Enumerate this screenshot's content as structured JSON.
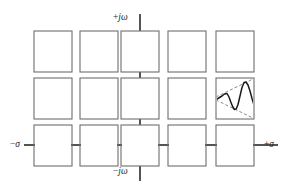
{
  "figure": {
    "type": "s-plane-pole-grid-diagram",
    "background": "#ffffff",
    "width": 292,
    "height": 193,
    "box_stroke": "#6e6e6e",
    "axis_stroke": "#2a2a2a",
    "signal_stroke": "#1a1a1a",
    "envelope_stroke": "#7a7a7a"
  },
  "axes": {
    "vertical": {
      "name": "imaginary-axis",
      "top_label": "+jω",
      "top_sign": "+",
      "top_symbol": "jω",
      "bottom_label": "−jω",
      "bottom_sign": "−",
      "bottom_symbol": "jω",
      "x": 140,
      "y_top": 14,
      "y_bottom": 181
    },
    "horizontal": {
      "name": "real-axis",
      "left_label": "−σ",
      "left_sign": "−",
      "left_symbol": "σ",
      "right_label": "+σ",
      "right_sign": "+",
      "right_symbol": "σ",
      "y": 145,
      "x_left": 24,
      "x_right": 278
    }
  },
  "grid": {
    "rows": 3,
    "cols": 5,
    "cell_w": 38,
    "cell_h": 41,
    "col_x": [
      34,
      90,
      121,
      177,
      219
    ],
    "row_y": [
      31,
      78,
      125
    ],
    "cells": [
      {
        "row": 0,
        "col": 0,
        "x": 34,
        "y": 31,
        "w": 38,
        "h": 41,
        "content": "empty"
      },
      {
        "row": 0,
        "col": 1,
        "x": 80,
        "y": 31,
        "w": 38,
        "h": 41,
        "content": "empty"
      },
      {
        "row": 0,
        "col": 2,
        "x": 121,
        "y": 31,
        "w": 38,
        "h": 41,
        "content": "empty"
      },
      {
        "row": 0,
        "col": 3,
        "x": 168,
        "y": 31,
        "w": 38,
        "h": 41,
        "content": "empty"
      },
      {
        "row": 0,
        "col": 4,
        "x": 216,
        "y": 31,
        "w": 38,
        "h": 41,
        "content": "empty"
      },
      {
        "row": 1,
        "col": 0,
        "x": 34,
        "y": 78,
        "w": 38,
        "h": 41,
        "content": "empty"
      },
      {
        "row": 1,
        "col": 1,
        "x": 80,
        "y": 78,
        "w": 38,
        "h": 41,
        "content": "empty"
      },
      {
        "row": 1,
        "col": 2,
        "x": 121,
        "y": 78,
        "w": 38,
        "h": 41,
        "content": "empty"
      },
      {
        "row": 1,
        "col": 3,
        "x": 168,
        "y": 78,
        "w": 38,
        "h": 41,
        "content": "empty"
      },
      {
        "row": 1,
        "col": 4,
        "x": 216,
        "y": 78,
        "w": 38,
        "h": 41,
        "content": "growing-oscillation-waveform"
      },
      {
        "row": 2,
        "col": 0,
        "x": 34,
        "y": 125,
        "w": 38,
        "h": 41,
        "content": "empty"
      },
      {
        "row": 2,
        "col": 1,
        "x": 80,
        "y": 125,
        "w": 38,
        "h": 41,
        "content": "empty"
      },
      {
        "row": 2,
        "col": 2,
        "x": 121,
        "y": 125,
        "w": 38,
        "h": 41,
        "content": "empty"
      },
      {
        "row": 2,
        "col": 3,
        "x": 168,
        "y": 125,
        "w": 38,
        "h": 41,
        "content": "empty"
      },
      {
        "row": 2,
        "col": 4,
        "x": 216,
        "y": 125,
        "w": 38,
        "h": 41,
        "content": "empty"
      }
    ]
  },
  "connectors": {
    "horizontal_segments": [
      {
        "x1": 24,
        "x2": 34,
        "y": 145
      },
      {
        "x1": 72,
        "x2": 80,
        "y": 145
      },
      {
        "x1": 118,
        "x2": 121,
        "y": 145
      },
      {
        "x1": 159,
        "x2": 168,
        "y": 145
      },
      {
        "x1": 206,
        "x2": 216,
        "y": 145
      },
      {
        "x1": 254,
        "x2": 278,
        "y": 145
      }
    ],
    "vertical_segments": [
      {
        "y1": 14,
        "y2": 31,
        "x": 140
      },
      {
        "y1": 72,
        "y2": 78,
        "x": 140
      },
      {
        "y1": 119,
        "y2": 125,
        "x": 140
      },
      {
        "y1": 166,
        "y2": 181,
        "x": 140
      }
    ]
  },
  "waveform": {
    "name": "growing-oscillation",
    "description": "damped-to-growing sinusoid with dashed exponential envelope",
    "baseline_y": 99,
    "signal_points": "217,99 220,97 223,95 226,93 229,96 231,102 233,107 235,110 237,109 239,103 241,94 243,86 245,82 247,83 249,89 251,97 253,104",
    "envelope_upper": "217,97 253,79",
    "envelope_lower": "217,100 253,117",
    "envelope_style": "dashed"
  }
}
